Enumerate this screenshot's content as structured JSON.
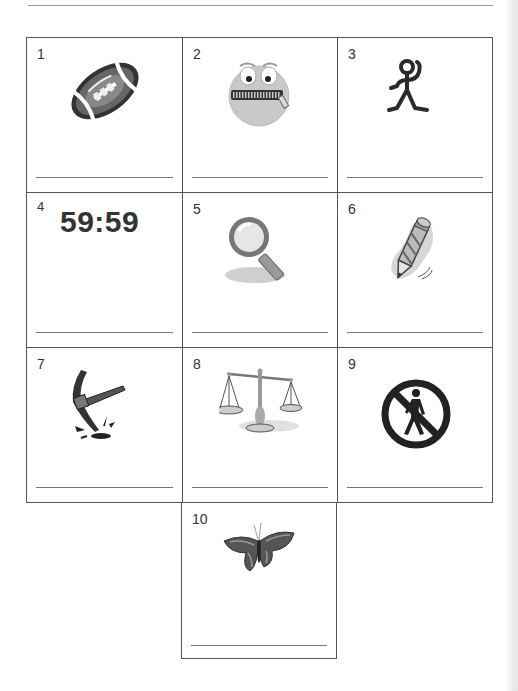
{
  "worksheet": {
    "cells": [
      {
        "number": "1",
        "picture": "football-icon",
        "answer": ""
      },
      {
        "number": "2",
        "picture": "zipped-mouth-face-icon",
        "answer": ""
      },
      {
        "number": "3",
        "picture": "stick-figure-icon",
        "answer": ""
      },
      {
        "number": "4",
        "picture": "digital-time-text",
        "text": "59:59",
        "answer": ""
      },
      {
        "number": "5",
        "picture": "magnifying-glass-icon",
        "answer": ""
      },
      {
        "number": "6",
        "picture": "pencil-writing-icon",
        "answer": ""
      },
      {
        "number": "7",
        "picture": "pickaxe-icon",
        "answer": ""
      },
      {
        "number": "8",
        "picture": "balance-scale-icon",
        "answer": ""
      },
      {
        "number": "9",
        "picture": "no-pedestrian-sign-icon",
        "answer": ""
      },
      {
        "number": "10",
        "picture": "butterfly-icon",
        "answer": ""
      }
    ]
  },
  "colors": {
    "grid_line": "#555555",
    "answer_line": "#777777",
    "ink": "#333333"
  }
}
